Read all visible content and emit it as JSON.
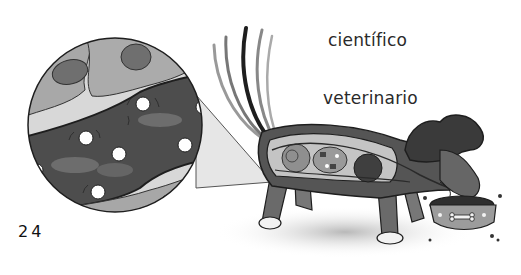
{
  "page": {
    "page_number": "24",
    "labels": [
      {
        "text": "científico"
      },
      {
        "text": "veterinario"
      }
    ]
  },
  "illustration": {
    "subject": "dog-eating-cutaway",
    "magnifier": "blood-vessel-cells-closeup",
    "bowl_decoration": "bone-icon"
  },
  "colors": {
    "ink": "#1e1e1e",
    "dark_gray": "#4a4a4a",
    "mid_gray": "#8a8a8a",
    "light_gray": "#b5b5b5",
    "pale_gray": "#d6d6d6",
    "background": "#ffffff"
  }
}
